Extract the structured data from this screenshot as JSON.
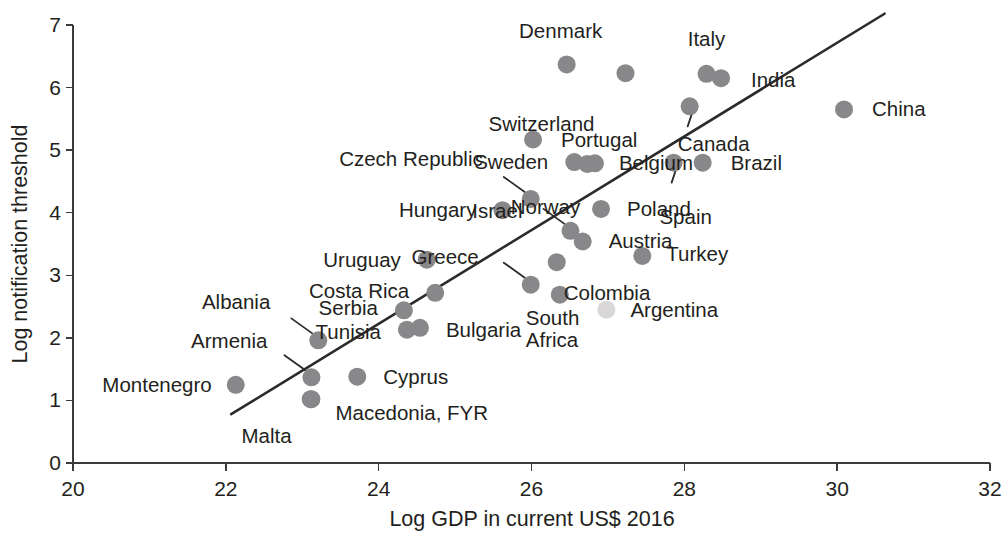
{
  "chart_data": {
    "type": "scatter",
    "title": "",
    "xlabel": "Log GDP in current US$ 2016",
    "ylabel": "Log notification threshold",
    "xlim": [
      20,
      32
    ],
    "ylim": [
      0,
      7
    ],
    "xticks": [
      "20",
      "22",
      "24",
      "26",
      "28",
      "30",
      "32"
    ],
    "yticks": [
      "0",
      "1",
      "2",
      "3",
      "4",
      "5",
      "6",
      "7"
    ],
    "grid": false,
    "legend": "none",
    "marker_color": "#888789",
    "trend_color": "#2d2a2b",
    "trendline": {
      "label": "fitted regression line",
      "x_start": 22.07,
      "y_start": 0.78,
      "x_end": 30.62,
      "y_end": 7.18
    },
    "points": [
      {
        "label": "Montenegro",
        "x": 22.13,
        "y": 1.25,
        "label_pos": "left",
        "faint": false
      },
      {
        "label": "Armenia",
        "x": 23.12,
        "y": 1.37,
        "label_pos": "leader-left",
        "faint": false
      },
      {
        "label": "Malta",
        "x": 23.11,
        "y": 1.02,
        "label_pos": "below-left",
        "faint": false
      },
      {
        "label": "Macedonia, FYR",
        "x": 23.12,
        "y": 1.02,
        "label_pos": "right",
        "faint": false
      },
      {
        "label": "Cyprus",
        "x": 23.72,
        "y": 1.38,
        "label_pos": "right",
        "faint": false
      },
      {
        "label": "Albania",
        "x": 23.21,
        "y": 1.96,
        "label_pos": "leader-left",
        "faint": false
      },
      {
        "label": "Tunisia",
        "x": 24.37,
        "y": 2.13,
        "label_pos": "left",
        "faint": false
      },
      {
        "label": "Bulgaria",
        "x": 24.54,
        "y": 2.16,
        "label_pos": "right",
        "faint": false
      },
      {
        "label": "Serbia",
        "x": 24.33,
        "y": 2.44,
        "label_pos": "left",
        "faint": false
      },
      {
        "label": "Costa Rica",
        "x": 24.74,
        "y": 2.72,
        "label_pos": "left",
        "faint": false
      },
      {
        "label": "Uruguay",
        "x": 24.63,
        "y": 3.25,
        "label_pos": "left",
        "faint": false
      },
      {
        "label": "Greece",
        "x": 25.99,
        "y": 2.85,
        "label_pos": "leader-left",
        "faint": false
      },
      {
        "label": "South Africa",
        "x": 26.37,
        "y": 2.69,
        "label_pos": "below-left",
        "faint": false
      },
      {
        "label": "Colombia",
        "x": 26.33,
        "y": 3.21,
        "label_pos": "below-right",
        "faint": false
      },
      {
        "label": "Argentina",
        "x": 26.98,
        "y": 2.45,
        "label_pos": "right",
        "faint": true
      },
      {
        "label": "Turkey",
        "x": 27.45,
        "y": 3.31,
        "label_pos": "right",
        "faint": false
      },
      {
        "label": "Austria",
        "x": 26.67,
        "y": 3.54,
        "label_pos": "right",
        "faint": false
      },
      {
        "label": "Israel",
        "x": 26.51,
        "y": 3.71,
        "label_pos": "leader-left",
        "faint": false
      },
      {
        "label": "Hungary",
        "x": 25.62,
        "y": 4.04,
        "label_pos": "left",
        "faint": false
      },
      {
        "label": "Poland",
        "x": 26.91,
        "y": 4.06,
        "label_pos": "right",
        "faint": false
      },
      {
        "label": "Czech Republic",
        "x": 25.99,
        "y": 4.22,
        "label_pos": "leader-left",
        "faint": false
      },
      {
        "label": "Norway",
        "x": 26.73,
        "y": 4.78,
        "label_pos": "below-left",
        "faint": false
      },
      {
        "label": "Sweden",
        "x": 26.56,
        "y": 4.81,
        "label_pos": "left",
        "faint": false
      },
      {
        "label": "Belgium",
        "x": 26.83,
        "y": 4.79,
        "label_pos": "right",
        "faint": false
      },
      {
        "label": "Spain",
        "x": 27.86,
        "y": 4.8,
        "label_pos": "leader-below",
        "faint": false
      },
      {
        "label": "Brazil",
        "x": 28.24,
        "y": 4.8,
        "label_pos": "right",
        "faint": false
      },
      {
        "label": "Portugal",
        "x": 26.02,
        "y": 5.17,
        "label_pos": "right",
        "faint": false
      },
      {
        "label": "Canada",
        "x": 28.07,
        "y": 5.7,
        "label_pos": "leader-below",
        "faint": false
      },
      {
        "label": "China",
        "x": 30.09,
        "y": 5.65,
        "label_pos": "right",
        "faint": false
      },
      {
        "label": "Switzerland",
        "x": 27.23,
        "y": 6.23,
        "label_pos": "below-left",
        "faint": false
      },
      {
        "label": "Denmark",
        "x": 26.46,
        "y": 6.37,
        "label_pos": "above",
        "faint": false
      },
      {
        "label": "Italy",
        "x": 28.29,
        "y": 6.22,
        "label_pos": "above",
        "faint": false
      },
      {
        "label": "India",
        "x": 28.48,
        "y": 6.15,
        "label_pos": "right",
        "faint": false
      }
    ]
  },
  "axes": {
    "x_title": "Log GDP in current US$ 2016",
    "y_title": "Log notification threshold"
  }
}
